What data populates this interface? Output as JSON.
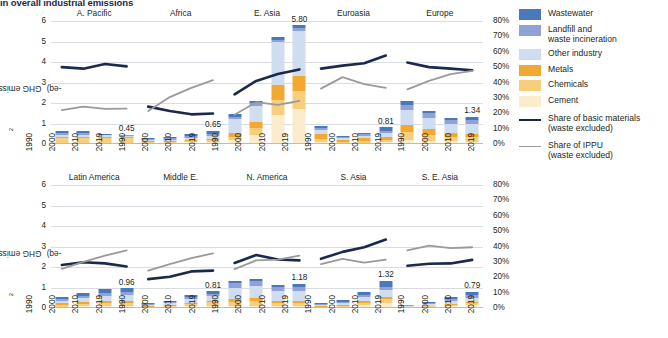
{
  "title": "in overall industrial emissions",
  "axis": {
    "y_label": "GHG emissions (GtCO",
    "y_label_sub": "2",
    "y_label_tail": "-eq)",
    "y_ticks": [
      "6",
      "5",
      "4",
      "3",
      "2",
      "1",
      "0"
    ],
    "y2_ticks": [
      "80%",
      "70%",
      "60%",
      "50%",
      "40%",
      "30%",
      "20%",
      "10%",
      "0%"
    ],
    "x_ticks": [
      "1990",
      "2000",
      "2010",
      "2019"
    ],
    "ylim": [
      0,
      6
    ],
    "y2lim": [
      0,
      80
    ]
  },
  "legend": {
    "items": [
      {
        "label": "Wastewater",
        "color": "#4a78bd",
        "type": "swatch"
      },
      {
        "label": "Landfill and\nwaste incineration",
        "color": "#8fa2d6",
        "type": "swatch"
      },
      {
        "label": "Other industry",
        "color": "#d0dcf0",
        "type": "swatch"
      },
      {
        "label": "Metals",
        "color": "#f2a932",
        "type": "swatch"
      },
      {
        "label": "Chemicals",
        "color": "#f8ce7c",
        "type": "swatch"
      },
      {
        "label": "Cement",
        "color": "#fceccb",
        "type": "swatch"
      }
    ],
    "lines": [
      {
        "label": "Share of basic materials\n(waste excluded)",
        "color": "#1b2a4a",
        "width": 2.2
      },
      {
        "label": "Share of IPPU\n(waste excluded)",
        "color": "#9a9a9a",
        "width": 1.6
      }
    ]
  },
  "colors": {
    "wastewater": "#4a78bd",
    "landfill": "#8fa2d6",
    "other_industry": "#d0dcf0",
    "metals": "#f2a932",
    "chemicals": "#f8ce7c",
    "cement": "#fceccb",
    "basic_materials_line": "#1b2a4a",
    "ippu_line": "#9a9a9a",
    "grid": "#d9dde3",
    "baseline": "#b9bcc1"
  },
  "chart_data": {
    "type": "bar",
    "title": "in overall industrial emissions",
    "xlabel": "",
    "ylabel": "GHG emissions (GtCO2-eq)",
    "ylim": [
      0,
      6
    ],
    "y2label": "Share (%)",
    "y2lim": [
      0,
      80
    ],
    "grid": true,
    "legend_position": "right",
    "categories": [
      "1990",
      "2000",
      "2010",
      "2019"
    ],
    "stack_order": [
      "Cement",
      "Chemicals",
      "Metals",
      "Other industry",
      "Landfill and waste incineration",
      "Wastewater"
    ],
    "panels": [
      {
        "name": "A. Pacific",
        "row": 1,
        "series": [
          {
            "name": "Cement",
            "values": [
              0.06,
              0.06,
              0.06,
              0.06
            ]
          },
          {
            "name": "Chemicals",
            "values": [
              0.22,
              0.22,
              0.22,
              0.21
            ]
          },
          {
            "name": "Metals",
            "values": [
              0.06,
              0.06,
              0.06,
              0.06
            ]
          },
          {
            "name": "Other industry",
            "values": [
              0.11,
              0.11,
              0.09,
              0.06
            ]
          },
          {
            "name": "Landfill and waste incineration",
            "values": [
              0.09,
              0.09,
              0.03,
              0.03
            ]
          },
          {
            "name": "Wastewater",
            "values": [
              0.09,
              0.08,
              0.04,
              0.03
            ]
          }
        ],
        "total_label": "0.45",
        "lines": [
          {
            "name": "Share of basic materials (waste excluded)",
            "values": [
              50,
              49,
              52,
              50.5
            ]
          },
          {
            "name": "Share of IPPU (waste excluded)",
            "values": [
              22,
              24.3,
              22.8,
              23
            ]
          }
        ]
      },
      {
        "name": "Africa",
        "row": 1,
        "series": [
          {
            "name": "Cement",
            "values": [
              0.05,
              0.06,
              0.09,
              0.12
            ]
          },
          {
            "name": "Chemicals",
            "values": [
              0.05,
              0.05,
              0.06,
              0.07
            ]
          },
          {
            "name": "Metals",
            "values": [
              0.04,
              0.04,
              0.05,
              0.06
            ]
          },
          {
            "name": "Other industry",
            "values": [
              0.06,
              0.07,
              0.09,
              0.12
            ]
          },
          {
            "name": "Landfill and waste incineration",
            "values": [
              0.05,
              0.06,
              0.08,
              0.12
            ]
          },
          {
            "name": "Wastewater",
            "values": [
              0.07,
              0.08,
              0.13,
              0.16
            ]
          }
        ],
        "total_label": "0.65",
        "lines": [
          {
            "name": "Share of basic materials (waste excluded)",
            "values": [
              24.3,
              21.5,
              19.3,
              19.8
            ]
          },
          {
            "name": "Share of IPPU (waste excluded)",
            "values": [
              21.5,
              30.5,
              36.5,
              41.5
            ]
          }
        ]
      },
      {
        "name": "E. Asia",
        "row": 1,
        "series": [
          {
            "name": "Cement",
            "values": [
              0.2,
              0.46,
              1.4,
              1.72
            ]
          },
          {
            "name": "Chemicals",
            "values": [
              0.14,
              0.3,
              0.75,
              0.85
            ]
          },
          {
            "name": "Metals",
            "values": [
              0.18,
              0.32,
              0.74,
              0.75
            ]
          },
          {
            "name": "Other industry",
            "values": [
              0.72,
              0.8,
              2.08,
              2.2
            ]
          },
          {
            "name": "Landfill and waste incineration",
            "values": [
              0.09,
              0.1,
              0.1,
              0.12
            ]
          },
          {
            "name": "Wastewater",
            "values": [
              0.12,
              0.13,
              0.14,
              0.16
            ]
          }
        ],
        "total_label": "5.80",
        "lines": [
          {
            "name": "Share of basic materials (waste excluded)",
            "values": [
              32.3,
              41,
              45.5,
              48.5
            ]
          },
          {
            "name": "Share of IPPU (waste excluded)",
            "values": [
              19,
              27.2,
              25.5,
              28
            ]
          }
        ]
      },
      {
        "name": "Euroasia",
        "row": 1,
        "series": [
          {
            "name": "Cement",
            "values": [
              0.1,
              0.05,
              0.07,
              0.09
            ]
          },
          {
            "name": "Chemicals",
            "values": [
              0.16,
              0.07,
              0.09,
              0.12
            ]
          },
          {
            "name": "Metals",
            "values": [
              0.22,
              0.09,
              0.12,
              0.14
            ]
          },
          {
            "name": "Other industry",
            "values": [
              0.22,
              0.09,
              0.12,
              0.17
            ]
          },
          {
            "name": "Landfill and waste incineration",
            "values": [
              0.08,
              0.04,
              0.07,
              0.14
            ]
          },
          {
            "name": "Wastewater",
            "values": [
              0.1,
              0.05,
              0.08,
              0.15
            ]
          }
        ],
        "total_label": "0.81",
        "lines": [
          {
            "name": "Share of basic materials (waste excluded)",
            "values": [
              49,
              51,
              52.5,
              57.5
            ]
          },
          {
            "name": "Share of IPPU (waste excluded)",
            "values": [
              36,
              43.5,
              39,
              36.5
            ]
          }
        ]
      },
      {
        "name": "Europe",
        "row": 1,
        "series": [
          {
            "name": "Cement",
            "values": [
              0.22,
              0.16,
              0.13,
              0.12
            ]
          },
          {
            "name": "Chemicals",
            "values": [
              0.35,
              0.28,
              0.22,
              0.2
            ]
          },
          {
            "name": "Metals",
            "values": [
              0.37,
              0.27,
              0.2,
              0.18
            ]
          },
          {
            "name": "Other industry",
            "values": [
              0.7,
              0.58,
              0.44,
              0.5
            ]
          },
          {
            "name": "Landfill and waste incineration",
            "values": [
              0.28,
              0.21,
              0.16,
              0.19
            ]
          },
          {
            "name": "Wastewater",
            "values": [
              0.16,
              0.12,
              0.1,
              0.15
            ]
          }
        ],
        "total_label": "1.34",
        "lines": [
          {
            "name": "Share of basic materials (waste excluded)",
            "values": [
              53,
              50,
              49,
              48
            ]
          },
          {
            "name": "Share of IPPU (waste excluded)",
            "values": [
              35.5,
              41,
              45.5,
              47.5
            ]
          }
        ]
      },
      {
        "name": "Latin America",
        "row": 2,
        "series": [
          {
            "name": "Cement",
            "values": [
              0.07,
              0.09,
              0.11,
              0.12
            ]
          },
          {
            "name": "Chemicals",
            "values": [
              0.09,
              0.11,
              0.13,
              0.13
            ]
          },
          {
            "name": "Metals",
            "values": [
              0.07,
              0.08,
              0.09,
              0.08
            ]
          },
          {
            "name": "Other industry",
            "values": [
              0.12,
              0.19,
              0.28,
              0.3
            ]
          },
          {
            "name": "Landfill and waste incineration",
            "values": [
              0.08,
              0.11,
              0.14,
              0.17
            ]
          },
          {
            "name": "Wastewater",
            "values": [
              0.09,
              0.13,
              0.16,
              0.16
            ]
          }
        ],
        "total_label": "0.96",
        "lines": [
          {
            "name": "Share of basic materials (waste excluded)",
            "values": [
              28,
              29.8,
              29,
              27
            ]
          },
          {
            "name": "Share of IPPU (waste excluded)",
            "values": [
              25.5,
              30,
              34,
              37.5
            ]
          }
        ]
      },
      {
        "name": "Middle E.",
        "row": 2,
        "series": [
          {
            "name": "Cement",
            "values": [
              0.03,
              0.05,
              0.09,
              0.12
            ]
          },
          {
            "name": "Chemicals",
            "values": [
              0.04,
              0.07,
              0.12,
              0.16
            ]
          },
          {
            "name": "Metals",
            "values": [
              0.02,
              0.03,
              0.05,
              0.07
            ]
          },
          {
            "name": "Other industry",
            "values": [
              0.06,
              0.09,
              0.18,
              0.22
            ]
          },
          {
            "name": "Landfill and waste incineration",
            "values": [
              0.04,
              0.06,
              0.1,
              0.11
            ]
          },
          {
            "name": "Wastewater",
            "values": [
              0.04,
              0.05,
              0.09,
              0.13
            ]
          }
        ],
        "total_label": "0.81",
        "lines": [
          {
            "name": "Share of basic materials (waste excluded)",
            "values": [
              18.8,
              20.3,
              23.8,
              24.3
            ]
          },
          {
            "name": "Share of IPPU (waste excluded)",
            "values": [
              24.3,
              28.5,
              32.5,
              35.5
            ]
          }
        ]
      },
      {
        "name": "N. America",
        "row": 2,
        "series": [
          {
            "name": "Cement",
            "values": [
              0.1,
              0.11,
              0.08,
              0.08
            ]
          },
          {
            "name": "Chemicals",
            "values": [
              0.2,
              0.23,
              0.16,
              0.17
            ]
          },
          {
            "name": "Metals",
            "values": [
              0.14,
              0.15,
              0.11,
              0.11
            ]
          },
          {
            "name": "Other industry",
            "values": [
              0.53,
              0.58,
              0.46,
              0.48
            ]
          },
          {
            "name": "Landfill and waste incineration",
            "values": [
              0.23,
              0.24,
              0.2,
              0.2
            ]
          },
          {
            "name": "Wastewater",
            "values": [
              0.13,
              0.13,
              0.12,
              0.14
            ]
          }
        ],
        "total_label": "1.18",
        "lines": [
          {
            "name": "Share of basic materials (waste excluded)",
            "values": [
              29.3,
              34.5,
              31.5,
              31
            ]
          },
          {
            "name": "Share of IPPU (waste excluded)",
            "values": [
              25.3,
              31,
              31.5,
              34
            ]
          }
        ]
      },
      {
        "name": "S. Asia",
        "row": 2,
        "series": [
          {
            "name": "Cement",
            "values": [
              0.04,
              0.07,
              0.15,
              0.26
            ]
          },
          {
            "name": "Chemicals",
            "values": [
              0.03,
              0.05,
              0.1,
              0.16
            ]
          },
          {
            "name": "Metals",
            "values": [
              0.02,
              0.04,
              0.08,
              0.14
            ]
          },
          {
            "name": "Other industry",
            "values": [
              0.06,
              0.09,
              0.2,
              0.32
            ]
          },
          {
            "name": "Landfill and waste incineration",
            "values": [
              0.03,
              0.05,
              0.09,
              0.14
            ]
          },
          {
            "name": "Wastewater",
            "values": [
              0.06,
              0.08,
              0.14,
              0.3
            ]
          }
        ],
        "total_label": "1.32",
        "lines": [
          {
            "name": "Share of basic materials (waste excluded)",
            "values": [
              32,
              36.5,
              39.5,
              44.5
            ]
          },
          {
            "name": "Share of IPPU (waste excluded)",
            "values": [
              28.5,
              32,
              29.5,
              31.5
            ]
          }
        ]
      },
      {
        "name": "S. E. Asia",
        "row": 2,
        "series": [
          {
            "name": "Cement",
            "values": [
              0.03,
              0.05,
              0.1,
              0.14
            ]
          },
          {
            "name": "Chemicals",
            "values": [
              0.02,
              0.04,
              0.07,
              0.1
            ]
          },
          {
            "name": "Metals",
            "values": [
              0.01,
              0.02,
              0.05,
              0.07
            ]
          },
          {
            "name": "Other industry",
            "values": [
              0.04,
              0.07,
              0.14,
              0.2
            ]
          },
          {
            "name": "Landfill and waste incineration",
            "values": [
              0.03,
              0.05,
              0.09,
              0.14
            ]
          },
          {
            "name": "Wastewater",
            "values": [
              0.03,
              0.05,
              0.09,
              0.14
            ]
          }
        ],
        "total_label": "0.79",
        "lines": [
          {
            "name": "Share of basic materials (waste excluded)",
            "values": [
              27.5,
              28.8,
              29,
              31.3
            ]
          },
          {
            "name": "Share of IPPU (waste excluded)",
            "values": [
              37.5,
              40.5,
              39,
              39.5
            ]
          }
        ]
      }
    ]
  }
}
